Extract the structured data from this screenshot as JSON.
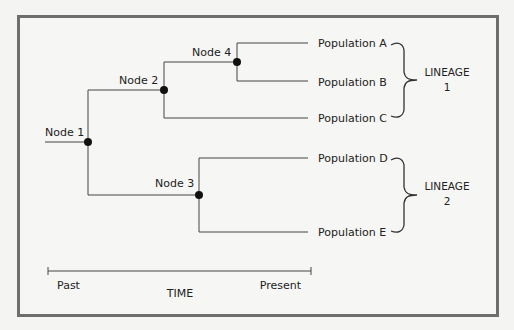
{
  "diagram": {
    "type": "phylogenetic-tree",
    "nodes": [
      {
        "id": "node1",
        "label": "Node 1"
      },
      {
        "id": "node2",
        "label": "Node 2"
      },
      {
        "id": "node3",
        "label": "Node 3"
      },
      {
        "id": "node4",
        "label": "Node 4"
      }
    ],
    "edges": [
      {
        "from": "node1",
        "to": "node2"
      },
      {
        "from": "node1",
        "to": "node3"
      },
      {
        "from": "node2",
        "to": "node4"
      },
      {
        "from": "node2",
        "to": "popC"
      },
      {
        "from": "node4",
        "to": "popA"
      },
      {
        "from": "node4",
        "to": "popB"
      },
      {
        "from": "node3",
        "to": "popD"
      },
      {
        "from": "node3",
        "to": "popE"
      }
    ],
    "populations": [
      {
        "id": "popA",
        "label": "Population A"
      },
      {
        "id": "popB",
        "label": "Population B"
      },
      {
        "id": "popC",
        "label": "Population C"
      },
      {
        "id": "popD",
        "label": "Population D"
      },
      {
        "id": "popE",
        "label": "Population E"
      }
    ],
    "lineages": [
      {
        "line1": "LINEAGE",
        "line2": "1",
        "members": [
          "popA",
          "popB",
          "popC"
        ]
      },
      {
        "line1": "LINEAGE",
        "line2": "2",
        "members": [
          "popD",
          "popE"
        ]
      }
    ],
    "time_axis": {
      "start_label": "Past",
      "end_label": "Present",
      "title": "TIME"
    }
  }
}
